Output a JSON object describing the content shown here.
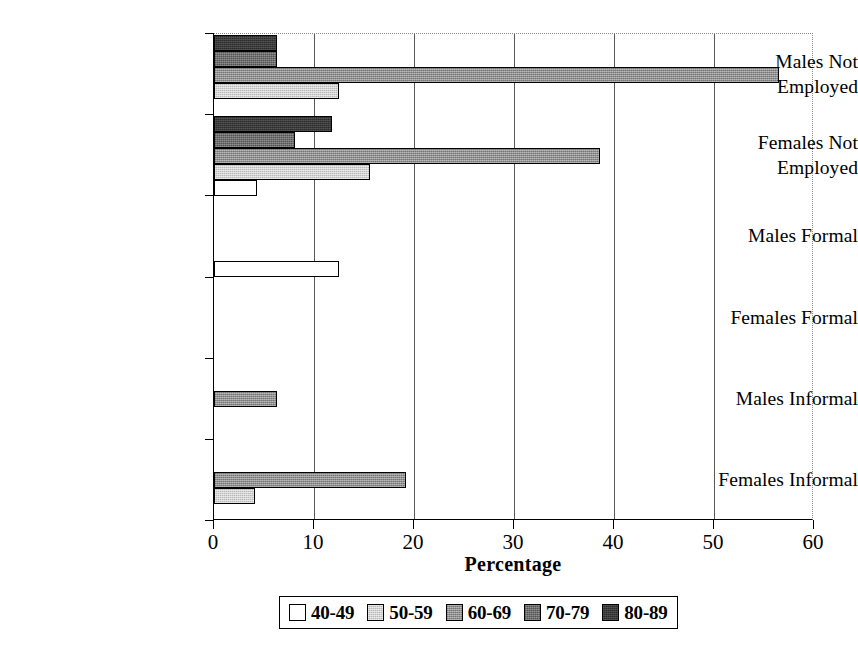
{
  "chart_data": {
    "type": "bar",
    "orientation": "horizontal",
    "title": "",
    "xlabel": "Percentage",
    "ylabel": "",
    "xlim": [
      0,
      60
    ],
    "xticks": [
      0,
      10,
      20,
      30,
      40,
      50,
      60
    ],
    "grid": true,
    "grid_axis": "x",
    "legend_position": "bottom",
    "categories": [
      "Males Not Employed",
      "Females Not Employed",
      "Males Formal",
      "Females Formal",
      "Males Informal",
      "Females Informal"
    ],
    "series": [
      {
        "name": "40-49",
        "color": "#ffffff",
        "values": [
          0,
          4.3,
          12.5,
          0,
          0,
          0
        ]
      },
      {
        "name": "50-59",
        "color": "#b9b9b9",
        "values": [
          12.5,
          15.6,
          0,
          0,
          0,
          4.1
        ]
      },
      {
        "name": "60-69",
        "color": "#8f8f8f",
        "values": [
          56.5,
          38.6,
          0,
          0,
          6.3,
          19.2
        ]
      },
      {
        "name": "70-79",
        "color": "#6e6e6e",
        "values": [
          6.3,
          8.1,
          0,
          0,
          0,
          0
        ]
      },
      {
        "name": "80-89",
        "color": "#2b2b2b",
        "values": [
          6.3,
          11.8,
          0,
          0,
          0,
          0
        ]
      }
    ]
  },
  "axis": {
    "x_tick_labels": [
      "0",
      "10",
      "20",
      "30",
      "40",
      "50",
      "60"
    ],
    "x_title": "Percentage"
  },
  "legend": {
    "entries": [
      {
        "label": "40-49",
        "swatch": "legend-swatch-40-49"
      },
      {
        "label": "50-59",
        "swatch": "legend-swatch-50-59"
      },
      {
        "label": "60-69",
        "swatch": "legend-swatch-60-69"
      },
      {
        "label": "70-79",
        "swatch": "legend-swatch-70-79"
      },
      {
        "label": "80-89",
        "swatch": "legend-swatch-80-89"
      }
    ]
  }
}
